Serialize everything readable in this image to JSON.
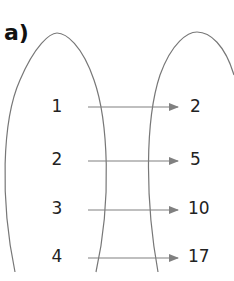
{
  "diagram": {
    "part_label": "a)",
    "type": "mapping-diagram",
    "domain_values": [
      "1",
      "2",
      "3",
      "4"
    ],
    "range_values": [
      "2",
      "5",
      "10",
      "17"
    ],
    "mappings": [
      {
        "from": "1",
        "to": "2"
      },
      {
        "from": "2",
        "to": "5"
      },
      {
        "from": "3",
        "to": "10"
      },
      {
        "from": "4",
        "to": "17"
      }
    ],
    "colors": {
      "oval_stroke": "#777777",
      "arrow": "#808080",
      "text": "#222222"
    }
  }
}
